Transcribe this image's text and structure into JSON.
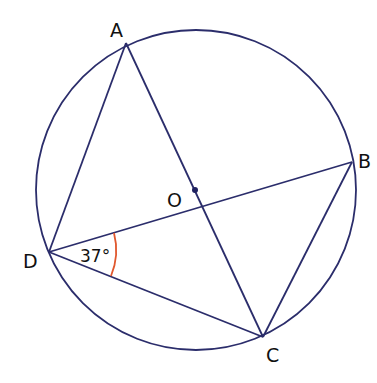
{
  "diagram": {
    "colors": {
      "line": "#2b2d6b",
      "angle_arc": "#e0582e",
      "text": "#111111",
      "background": "#ffffff"
    },
    "circle": {
      "cx": 196,
      "cy": 190,
      "r": 160
    },
    "points": {
      "A": {
        "label": "A",
        "x": 126,
        "y": 43
      },
      "B": {
        "label": "B",
        "x": 352,
        "y": 162
      },
      "C": {
        "label": "C",
        "x": 263,
        "y": 337
      },
      "D": {
        "label": "D",
        "x": 49,
        "y": 252
      },
      "O": {
        "label": "O",
        "x": 195,
        "y": 190
      }
    },
    "segments": [
      "AD",
      "AC",
      "DB",
      "DC",
      "BC"
    ],
    "angle": {
      "vertex": "D",
      "between": [
        "DB",
        "DC"
      ],
      "label": "37°"
    }
  }
}
